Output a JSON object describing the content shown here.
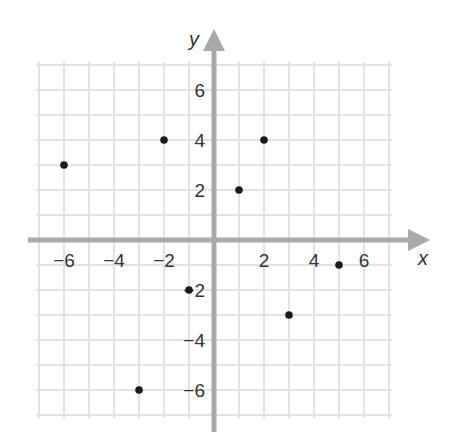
{
  "chart_data": {
    "type": "scatter",
    "title": "",
    "xlabel": "x",
    "ylabel": "y",
    "xlim": [
      -7,
      7
    ],
    "ylim": [
      -7,
      7
    ],
    "grid": true,
    "x_ticks": [
      -6,
      -4,
      -2,
      2,
      4,
      6
    ],
    "y_ticks": [
      6,
      4,
      2,
      -2,
      -4,
      -6
    ],
    "x_tick_labels": [
      "−6",
      "−4",
      "−2",
      "2",
      "4",
      "6"
    ],
    "y_tick_labels": [
      "6",
      "4",
      "2",
      "−2",
      "−4",
      "−6"
    ],
    "points": [
      {
        "x": -6,
        "y": 3
      },
      {
        "x": -2,
        "y": 4
      },
      {
        "x": 1,
        "y": 2
      },
      {
        "x": 2,
        "y": 4
      },
      {
        "x": 5,
        "y": -1
      },
      {
        "x": 3,
        "y": -3
      },
      {
        "x": -1,
        "y": -2
      },
      {
        "x": -3,
        "y": -6
      }
    ],
    "colors": {
      "grid": "#e2e2e2",
      "axis": "#a9a9a9",
      "point": "#1a1a1a",
      "text": "#333333"
    }
  }
}
